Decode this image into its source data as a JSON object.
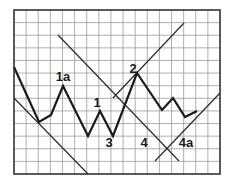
{
  "diagram": {
    "type": "elliott-wave-trendline-chart",
    "frame": {
      "x0": 14,
      "y0": 10,
      "x1": 220,
      "y1": 174
    },
    "grid": {
      "columns": 17,
      "rows": 13,
      "line_color": "#9a9a9a",
      "frame_color": "#333333"
    },
    "colors": {
      "price_line": "#1a1a1a",
      "trendline": "#2a2a2a",
      "background": "#ffffff"
    },
    "price_path": [
      [
        14,
        67
      ],
      [
        39,
        122
      ],
      [
        51,
        115
      ],
      [
        63,
        86
      ],
      [
        88,
        136
      ],
      [
        100,
        111
      ],
      [
        113,
        136
      ],
      [
        137,
        73
      ],
      [
        162,
        110
      ],
      [
        173,
        98
      ],
      [
        185,
        117
      ],
      [
        197,
        111
      ]
    ],
    "trendlines": [
      {
        "name": "lower-left-descending-trendline",
        "from": [
          14,
          98
        ],
        "to": [
          88,
          174
        ]
      },
      {
        "name": "long-descending-trendline",
        "from": [
          58,
          35
        ],
        "to": [
          179,
          161
        ]
      },
      {
        "name": "ascending-trendline-through-2",
        "from": [
          113,
          98
        ],
        "to": [
          184,
          23
        ]
      },
      {
        "name": "lower-right-ascending-trendline",
        "from": [
          155,
          161
        ],
        "to": [
          220,
          93
        ]
      }
    ],
    "labels": [
      {
        "name": "label-1a",
        "text": "1a",
        "x": 63,
        "y": 81
      },
      {
        "name": "label-1",
        "text": "1",
        "x": 97,
        "y": 107
      },
      {
        "name": "label-2",
        "text": "2",
        "x": 133,
        "y": 73
      },
      {
        "name": "label-3",
        "text": "3",
        "x": 109,
        "y": 147
      },
      {
        "name": "label-4",
        "text": "4",
        "x": 144,
        "y": 147
      },
      {
        "name": "label-4a",
        "text": "4a",
        "x": 186,
        "y": 147
      }
    ]
  }
}
